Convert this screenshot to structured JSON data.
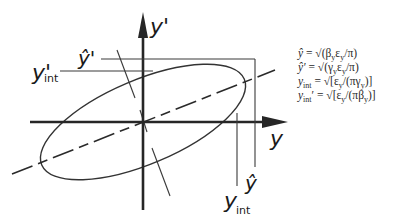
{
  "diagram": {
    "axes": {
      "horizontal_label": "y",
      "vertical_label": "y'"
    },
    "markers": {
      "y_hat": "ŷ",
      "y_prime_hat": "ŷ'",
      "y_int": "y",
      "y_int_sub": "int",
      "y_int_prime": "y'",
      "y_int_prime_sub": "int"
    },
    "equations": [
      "ŷ = √(βᵧεᵧ/π)",
      "ŷ' = √(γᵧεᵧ/π)",
      "y_int = √[εᵧ/(πγᵧ)]",
      "y_int' = √[εᵧ/(πβᵧ)]"
    ],
    "equation_parts": [
      {
        "lhs": "ŷ",
        "rhs": " = √(β",
        "s1": "y",
        "m1": "ε",
        "s2": "y",
        "tail": "/π)"
      },
      {
        "lhs": "ŷ'",
        "rhs": " = √(γ",
        "s1": "y",
        "m1": "ε",
        "s2": "y",
        "tail": "/π)"
      },
      {
        "lhs": "y",
        "lsub": "int",
        "rhs": " = √[ε",
        "s1": "y",
        "m1": "/(πγ",
        "s2": "y",
        "tail": ")]"
      },
      {
        "lhs": "y",
        "lsub": "int",
        "lsup": "′",
        "rhs": " = √[ε",
        "s1": "y",
        "m1": "/(πβ",
        "s2": "y",
        "tail": ")]"
      }
    ]
  }
}
